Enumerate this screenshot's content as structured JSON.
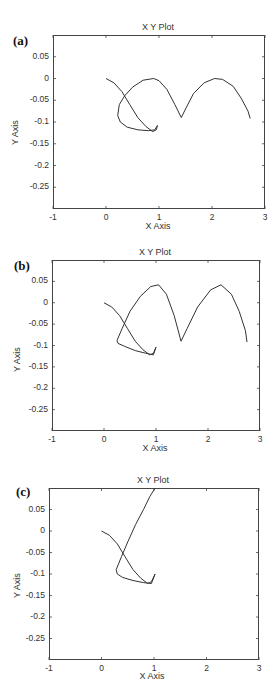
{
  "chart_data": [
    {
      "panel": "(a)",
      "type": "line",
      "title": "X Y Plot",
      "xlabel": "X Axis",
      "ylabel": "Y Axis",
      "xlim": [
        -1,
        3
      ],
      "ylim": [
        -0.3,
        0.1
      ],
      "xticks": [
        "-1",
        "0",
        "1",
        "2",
        "3"
      ],
      "yticks": [
        "0.05",
        "0",
        "-0.05",
        "-0.1",
        "-0.15",
        "-0.2",
        "-0.25"
      ],
      "grid": false,
      "series": [
        {
          "name": "trajectory",
          "x": [
            0,
            0.15,
            0.3,
            0.45,
            0.6,
            0.75,
            0.88,
            0.95,
            0.97,
            0.92,
            0.8,
            0.6,
            0.4,
            0.27,
            0.22,
            0.25,
            0.35,
            0.5,
            0.7,
            0.9,
            1.0,
            1.15,
            1.3,
            1.42,
            1.5,
            1.65,
            1.85,
            2.05,
            2.2,
            2.4,
            2.55,
            2.68,
            2.72
          ],
          "y": [
            0,
            -0.01,
            -0.03,
            -0.06,
            -0.09,
            -0.11,
            -0.122,
            -0.118,
            -0.108,
            -0.118,
            -0.12,
            -0.118,
            -0.112,
            -0.1,
            -0.085,
            -0.06,
            -0.04,
            -0.02,
            -0.004,
            0,
            -0.005,
            -0.025,
            -0.06,
            -0.09,
            -0.07,
            -0.035,
            -0.01,
            0,
            -0.002,
            -0.018,
            -0.045,
            -0.075,
            -0.092
          ]
        }
      ]
    },
    {
      "panel": "(b)",
      "type": "line",
      "title": "X Y Plot",
      "xlabel": "X Axis",
      "ylabel": "Y Axis",
      "xlim": [
        -1,
        3
      ],
      "ylim": [
        -0.3,
        0.1
      ],
      "xticks": [
        "-1",
        "0",
        "1",
        "2",
        "3"
      ],
      "yticks": [
        "0.05",
        "0",
        "-0.05",
        "-0.1",
        "-0.15",
        "-0.2",
        "-0.25"
      ],
      "grid": false,
      "series": [
        {
          "name": "trajectory",
          "x": [
            0,
            0.15,
            0.3,
            0.45,
            0.6,
            0.75,
            0.88,
            0.95,
            1.0,
            0.95,
            0.8,
            0.6,
            0.4,
            0.27,
            0.25,
            0.35,
            0.5,
            0.7,
            0.9,
            1.05,
            1.2,
            1.35,
            1.48,
            1.6,
            1.8,
            2.05,
            2.25,
            2.45,
            2.6,
            2.72,
            2.75
          ],
          "y": [
            0,
            -0.01,
            -0.03,
            -0.06,
            -0.09,
            -0.11,
            -0.122,
            -0.118,
            -0.104,
            -0.122,
            -0.118,
            -0.112,
            -0.102,
            -0.095,
            -0.088,
            -0.06,
            -0.02,
            0.015,
            0.038,
            0.042,
            0.02,
            -0.03,
            -0.09,
            -0.06,
            -0.01,
            0.03,
            0.042,
            0.02,
            -0.02,
            -0.065,
            -0.092
          ]
        }
      ]
    },
    {
      "panel": "(c)",
      "type": "line",
      "title": "X Y Plot",
      "xlabel": "X Axis",
      "ylabel": "Y Axis",
      "xlim": [
        -1,
        3
      ],
      "ylim": [
        -0.3,
        0.1
      ],
      "xticks": [
        "-1",
        "0",
        "1",
        "2",
        "3"
      ],
      "yticks": [
        "0.05",
        "0",
        "-0.05",
        "-0.1",
        "-0.15",
        "-0.2",
        "-0.25"
      ],
      "grid": false,
      "series": [
        {
          "name": "trajectory",
          "x": [
            0,
            0.15,
            0.3,
            0.45,
            0.6,
            0.75,
            0.88,
            0.95,
            1.02,
            0.95,
            0.8,
            0.6,
            0.4,
            0.3,
            0.28,
            0.38,
            0.5,
            0.65,
            0.8,
            0.92,
            1.02
          ],
          "y": [
            0,
            -0.01,
            -0.03,
            -0.06,
            -0.09,
            -0.11,
            -0.122,
            -0.118,
            -0.1,
            -0.122,
            -0.12,
            -0.115,
            -0.108,
            -0.1,
            -0.09,
            -0.06,
            -0.025,
            0.015,
            0.05,
            0.08,
            0.1
          ]
        }
      ]
    }
  ],
  "panels": [
    {
      "label": "(a)",
      "title": "X Y Plot",
      "xlabel": "X Axis",
      "ylabel": "Y Axis"
    },
    {
      "label": "(b)",
      "title": "X Y Plot",
      "xlabel": "X Axis",
      "ylabel": "Y Axis"
    },
    {
      "label": "(c)",
      "title": "X Y Plot",
      "xlabel": "X Axis",
      "ylabel": "Y Axis"
    }
  ],
  "colors": {
    "line": "#333333",
    "axes": "#444444",
    "background": "#ffffff"
  }
}
